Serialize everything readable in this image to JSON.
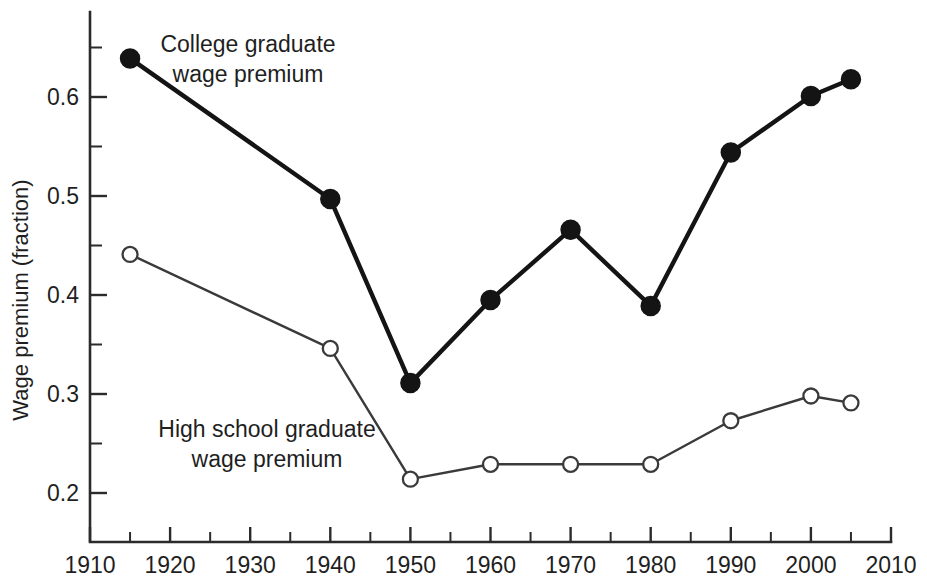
{
  "chart_data": {
    "type": "line",
    "title": "",
    "xlabel": "",
    "ylabel": "Wage premium (fraction)",
    "xlim": [
      1910,
      2010
    ],
    "ylim": [
      0.17,
      0.675
    ],
    "grid": false,
    "legend": "inline-annotations",
    "x_ticks": [
      1910,
      1920,
      1930,
      1940,
      1950,
      1960,
      1970,
      1980,
      1990,
      2000,
      2010
    ],
    "x_tick_labels": [
      "1910",
      "1920",
      "1930",
      "1940",
      "1950",
      "1960",
      "1970",
      "1980",
      "1990",
      "2000",
      "2010"
    ],
    "x_minor_ticks": [
      1915,
      1925,
      1935,
      1945,
      1955,
      1965,
      1975,
      1985,
      1995,
      2005
    ],
    "y_ticks": [
      0.2,
      0.3,
      0.4,
      0.5,
      0.6
    ],
    "y_tick_labels": [
      "0.2",
      "0.3",
      "0.4",
      "0.5",
      "0.6"
    ],
    "y_minor_ticks": [
      0.25,
      0.35,
      0.45,
      0.55,
      0.65
    ],
    "x": [
      1915,
      1940,
      1950,
      1960,
      1970,
      1980,
      1990,
      2000,
      2005
    ],
    "series": [
      {
        "name": "College graduate wage premium",
        "marker": "filled-circle",
        "values": [
          0.639,
          0.497,
          0.311,
          0.395,
          0.466,
          0.389,
          0.544,
          0.601,
          0.618
        ]
      },
      {
        "name": "High school graduate wage premium",
        "marker": "open-circle",
        "values": [
          0.441,
          0.346,
          0.214,
          0.229,
          0.229,
          0.229,
          0.273,
          0.298,
          0.291
        ]
      }
    ],
    "annotations": [
      {
        "id": "college-annotation",
        "lines": [
          "College graduate",
          "wage premium"
        ],
        "x_px": 248,
        "y_px": 52
      },
      {
        "id": "high-school-annotation",
        "lines": [
          "High school graduate",
          "wage premium"
        ],
        "x_px": 267,
        "y_px": 437
      }
    ],
    "colors": {
      "college": "#141414",
      "high_school": "#3a3a3a",
      "axis": "#2b2b2b",
      "background": "#ffffff"
    }
  }
}
